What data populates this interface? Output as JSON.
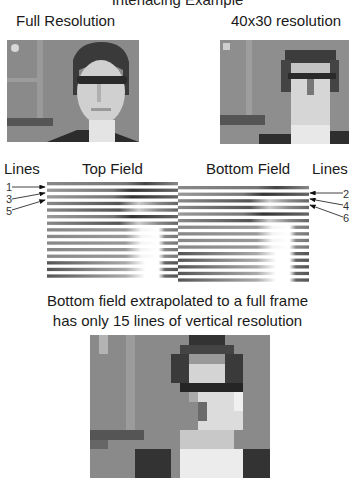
{
  "clipped_title": "Interlacing Example",
  "top_labels": {
    "full_resolution": "Full Resolution",
    "low_resolution": "40x30 resolution"
  },
  "fields": {
    "lines_left": "Lines",
    "lines_right": "Lines",
    "top_field": "Top Field",
    "bottom_field": "Bottom Field",
    "top_field_line_numbers": [
      "1",
      "3",
      "5"
    ],
    "bottom_field_line_numbers": [
      "2",
      "4",
      "6"
    ]
  },
  "caption": {
    "line1": "Bottom field extrapolated to a full frame",
    "line2": "has only 15 lines of vertical resolution"
  },
  "colors": {
    "background": "#ffffff",
    "photo_gray": "#8c8c8c",
    "text": "#1a1a1a"
  }
}
